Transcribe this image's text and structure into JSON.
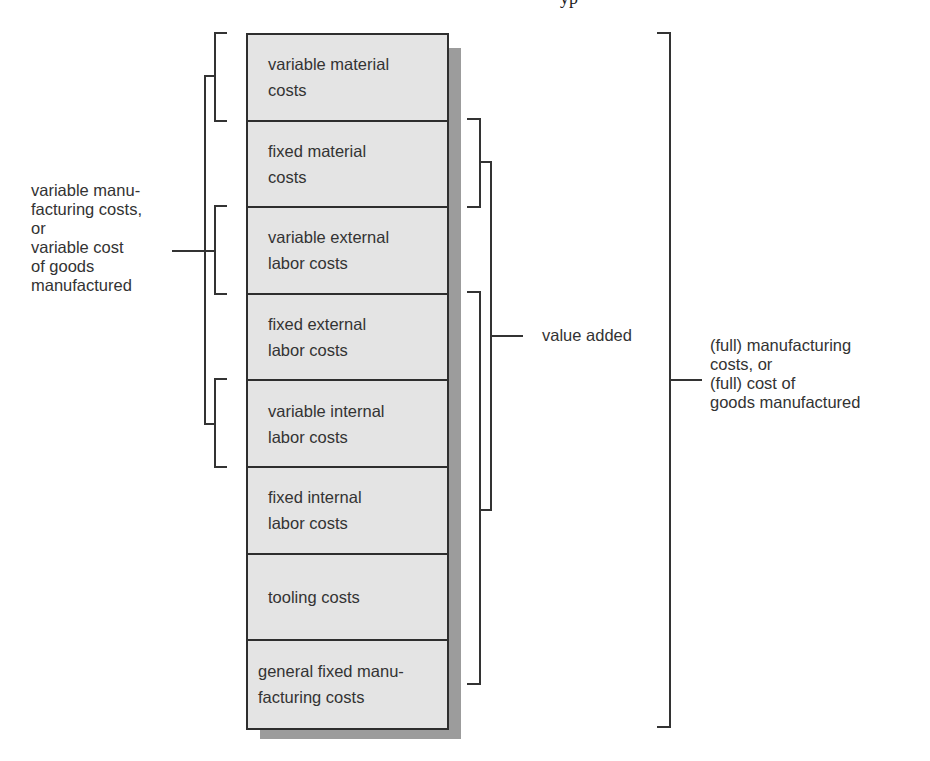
{
  "title_fragment": "yp",
  "stack": {
    "cells": [
      {
        "label": "variable material\ncosts"
      },
      {
        "label": "fixed material\ncosts"
      },
      {
        "label": "variable external\nlabor costs"
      },
      {
        "label": "fixed external\nlabor costs"
      },
      {
        "label": "variable internal\nlabor costs"
      },
      {
        "label": "fixed internal\nlabor costs"
      },
      {
        "label": "tooling costs"
      },
      {
        "label": "general fixed manu-\nfacturing costs"
      }
    ]
  },
  "groups": {
    "variable": {
      "label": "variable manu-\nfacturing costs,\nor\nvariable cost\nof goods\nmanufactured",
      "covers": [
        0,
        2,
        4
      ]
    },
    "value_added": {
      "label": "value added",
      "covers": [
        1,
        3,
        4,
        5,
        6,
        7
      ]
    },
    "full": {
      "label": "(full) manufacturing\ncosts, or\n(full) cost of\ngoods manufactured",
      "covers": [
        0,
        1,
        2,
        3,
        4,
        5,
        6,
        7
      ]
    }
  },
  "colors": {
    "cell_fill": "#e4e4e4",
    "shadow": "#9c9c9c",
    "line": "#2e2e2e",
    "text": "#333333"
  }
}
